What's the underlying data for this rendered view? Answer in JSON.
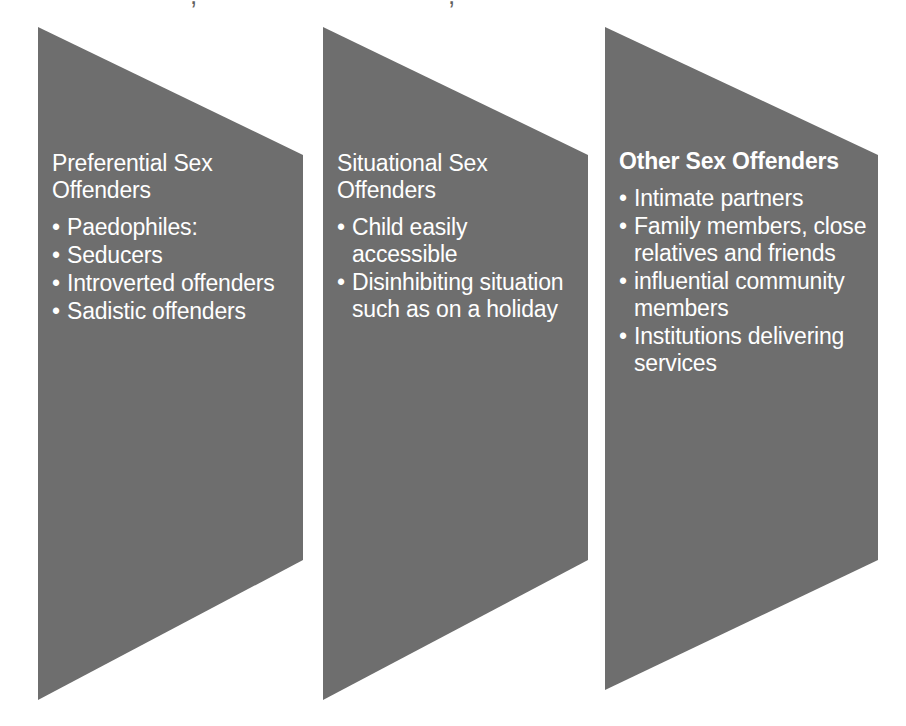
{
  "diagram": {
    "background_color": "#ffffff",
    "shape_color": "#6e6e6e",
    "text_color": "#ffffff",
    "shape_type": "right-pointing-chevron-trapezoid",
    "top_clipped_text": ","
  },
  "panels": [
    {
      "id": "preferential",
      "title": "Preferential Sex\nOffenders",
      "title_bold": false,
      "bullet_char": "•",
      "bullets": [
        "Paedophiles:",
        "Seducers",
        "Introverted offenders",
        "Sadistic offenders"
      ]
    },
    {
      "id": "situational",
      "title": "Situational Sex\nOffenders",
      "title_bold": false,
      "bullet_char": "•",
      "bullets": [
        "Child easily accessible",
        "Disinhibiting situation such as on a holiday"
      ]
    },
    {
      "id": "other",
      "title": "Other Sex Offenders",
      "title_bold": true,
      "bullet_char": "•",
      "bullets": [
        "Intimate partners",
        "Family members, close relatives and friends",
        "influential community members",
        "Institutions delivering services"
      ]
    }
  ],
  "geometry": {
    "shapes": [
      {
        "left_x": 38,
        "right_x": 303,
        "top_y": 27,
        "right_top_y": 155,
        "right_bottom_y": 560,
        "bottom_y": 700
      },
      {
        "left_x": 323,
        "right_x": 588,
        "top_y": 27,
        "right_top_y": 155,
        "right_bottom_y": 560,
        "bottom_y": 700
      },
      {
        "left_x": 605,
        "right_x": 878,
        "top_y": 27,
        "right_top_y": 155,
        "right_bottom_y": 560,
        "bottom_y": 690
      }
    ]
  }
}
